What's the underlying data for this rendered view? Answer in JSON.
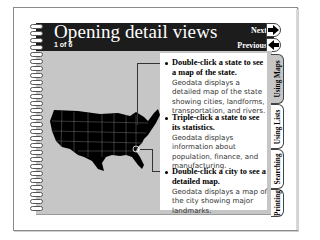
{
  "page": {
    "title": "Opening detail views",
    "counter": "1 of 6"
  },
  "navigation": {
    "next_label": "Next",
    "previous_label": "Previous",
    "next_icon": "arrow-right-icon",
    "previous_icon": "arrow-left-icon"
  },
  "tabs": [
    {
      "label": "Using Maps",
      "active": true
    },
    {
      "label": "Using Lists",
      "active": false
    },
    {
      "label": "Searching",
      "active": false
    },
    {
      "label": "Printing",
      "active": false
    }
  ],
  "content": {
    "items": [
      {
        "heading": "Double-click a state to see a map of the state.",
        "body": "Geodata displays a detailed map of the state showing cities, landforms, transportation, and rivers."
      },
      {
        "heading": "Triple-click a state to see its statistics.",
        "body": "Geodata displays information about population, finance, and manufacturing."
      },
      {
        "heading": "Double-click a city to see a detailed map.",
        "body": "Geodata displays a map of the city showing major landmarks."
      }
    ]
  },
  "illustration": {
    "name": "us-map",
    "fill": "#000000",
    "highlight": "city-circle"
  },
  "colors": {
    "header": "#1c1c1c",
    "panel": "#c6c6c6",
    "text_box": "#ffffff"
  }
}
